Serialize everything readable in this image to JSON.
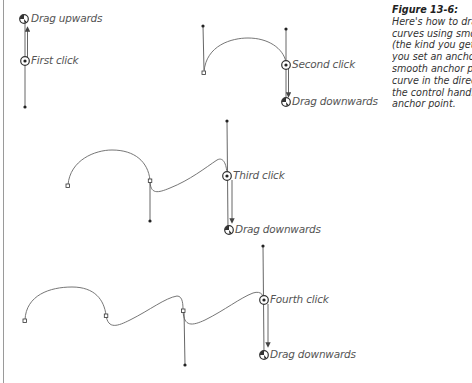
{
  "caption": {
    "figure_label": "Figure 13-6:",
    "lines": [
      "Here's how to draw c",
      "curves using smooth",
      "(the kind you get by",
      "you set an anchor po",
      "smooth anchor point",
      "curve in the direction",
      "the control handle of",
      "anchor point."
    ]
  },
  "panels": [
    {
      "id": 1,
      "click_label": "First click",
      "drag_label": "Drag upwards"
    },
    {
      "id": 2,
      "click_label": "Second click",
      "drag_label": "Drag downwards"
    },
    {
      "id": 3,
      "click_label": "Third click",
      "drag_label": "Drag downwards"
    },
    {
      "id": 4,
      "click_label": "Fourth click",
      "drag_label": "Drag downwards"
    }
  ],
  "colors": {
    "stroke": "#555555",
    "text": "#555555",
    "border": "#9a9a9a"
  }
}
